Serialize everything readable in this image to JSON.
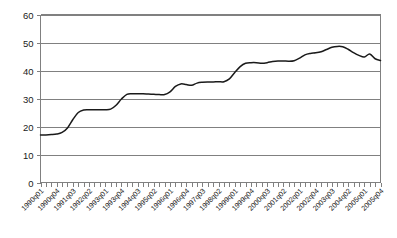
{
  "chart_data": {
    "type": "line",
    "title": "",
    "xlabel": "",
    "ylabel": "",
    "ylim": [
      0,
      60
    ],
    "yticks": [
      0,
      10,
      20,
      30,
      40,
      50,
      60
    ],
    "grid": true,
    "legend": "none",
    "xtick_labels": [
      "1990q01",
      "1990q04",
      "1991q03",
      "1992q02",
      "1993q01",
      "1993q04",
      "1994q03",
      "1995q02",
      "1996q01",
      "1996q04",
      "1997q03",
      "1998q02",
      "1999q01",
      "1999q04",
      "2000q03",
      "2001q02",
      "2002q01",
      "2002q04",
      "2003q03",
      "2004q02",
      "2005q01",
      "2005q04"
    ],
    "xtick_interval_quarters": 3,
    "x": [
      "1990q01",
      "1990q02",
      "1990q03",
      "1990q04",
      "1991q01",
      "1991q02",
      "1991q03",
      "1991q04",
      "1992q01",
      "1992q02",
      "1992q03",
      "1992q04",
      "1993q01",
      "1993q02",
      "1993q03",
      "1993q04",
      "1994q01",
      "1994q02",
      "1994q03",
      "1994q04",
      "1995q01",
      "1995q02",
      "1995q03",
      "1995q04",
      "1996q01",
      "1996q02",
      "1996q03",
      "1996q04",
      "1997q01",
      "1997q02",
      "1997q03",
      "1997q04",
      "1998q01",
      "1998q02",
      "1998q03",
      "1998q04",
      "1999q01",
      "1999q02",
      "1999q03",
      "1999q04",
      "2000q01",
      "2000q02",
      "2000q03",
      "2000q04",
      "2001q01",
      "2001q02",
      "2001q03",
      "2001q04",
      "2002q01",
      "2002q02",
      "2002q03",
      "2002q04",
      "2003q01",
      "2003q02",
      "2003q03",
      "2003q04",
      "2004q01",
      "2004q02",
      "2004q03",
      "2004q04",
      "2005q01",
      "2005q02",
      "2005q03",
      "2005q04"
    ],
    "values": [
      17.0,
      17.0,
      17.1,
      17.3,
      17.9,
      19.5,
      22.5,
      25.0,
      25.9,
      26.0,
      26.0,
      26.0,
      26.0,
      26.2,
      27.6,
      29.8,
      31.5,
      31.7,
      31.7,
      31.7,
      31.6,
      31.5,
      31.4,
      31.4,
      32.4,
      34.3,
      35.2,
      35.0,
      34.7,
      35.5,
      35.8,
      35.9,
      35.9,
      36.0,
      36.0,
      37.0,
      39.3,
      41.4,
      42.6,
      42.8,
      42.8,
      42.6,
      42.8,
      43.2,
      43.4,
      43.4,
      43.3,
      43.5,
      44.4,
      45.6,
      46.1,
      46.3,
      46.7,
      47.5,
      48.3,
      48.6,
      48.5,
      47.6,
      46.4,
      45.4,
      44.8,
      45.9,
      44.2,
      43.6
    ],
    "final_value": 45.9
  },
  "colors": {
    "line": "#1a1a1a",
    "grid": "#808080",
    "axis": "#808080",
    "background": "#ffffff",
    "text": "#1a1a1a"
  }
}
